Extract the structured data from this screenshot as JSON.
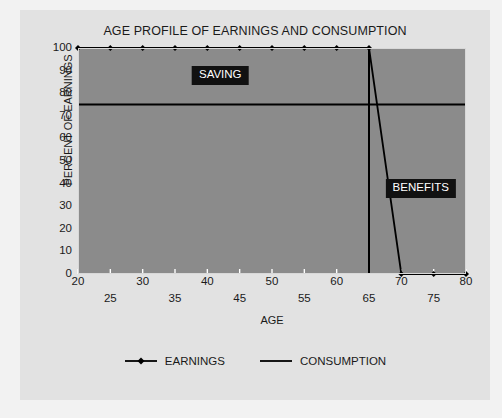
{
  "chart_data": {
    "type": "line",
    "title": "AGE PROFILE OF EARNINGS AND CONSUMPTION",
    "xlabel": "AGE",
    "ylabel": "PERCENT OF EARNINGS",
    "xlim": [
      20,
      80
    ],
    "ylim": [
      0,
      100
    ],
    "grid": false,
    "legend_position": "bottom",
    "x": [
      20,
      25,
      30,
      35,
      40,
      45,
      50,
      55,
      60,
      65,
      70,
      75,
      80
    ],
    "x_tick_labels_upper": [
      "20",
      "30",
      "40",
      "50",
      "60",
      "70",
      "80"
    ],
    "x_tick_values_upper": [
      20,
      30,
      40,
      50,
      60,
      70,
      80
    ],
    "x_tick_labels_lower": [
      "25",
      "35",
      "45",
      "55",
      "65",
      "75"
    ],
    "x_tick_values_lower": [
      25,
      35,
      45,
      55,
      65,
      75
    ],
    "y_tick_labels": [
      "100",
      "90",
      "80",
      "70",
      "60",
      "50",
      "40",
      "30",
      "20",
      "10",
      "0"
    ],
    "y_tick_values": [
      100,
      90,
      80,
      70,
      60,
      50,
      40,
      30,
      20,
      10,
      0
    ],
    "series": [
      {
        "name": "EARNINGS",
        "marker": "diamond",
        "color": "#000000",
        "values": [
          100,
          100,
          100,
          100,
          100,
          100,
          100,
          100,
          100,
          100,
          0,
          0,
          0
        ]
      },
      {
        "name": "CONSUMPTION",
        "marker": "none",
        "color": "#000000",
        "values": [
          75,
          75,
          75,
          75,
          75,
          75,
          75,
          75,
          75,
          75,
          75,
          75,
          75
        ]
      }
    ],
    "annotations": [
      {
        "label": "SAVING",
        "x": 42,
        "y": 88
      },
      {
        "label": "BENEFITS",
        "x": 73,
        "y": 38
      }
    ],
    "vertical_marker": {
      "x": 65,
      "y_from": 0,
      "y_to": 100
    }
  },
  "legend": {
    "items": [
      {
        "label": "EARNINGS",
        "marker": "diamond"
      },
      {
        "label": "CONSUMPTION",
        "marker": "none"
      }
    ]
  },
  "colors": {
    "plot_fill": "#8b8b8b",
    "panel_background": "#e2e2e2",
    "page_background": "#f2f2f2",
    "line": "#000000",
    "annotation_background": "#111111",
    "annotation_text": "#ffffff"
  }
}
